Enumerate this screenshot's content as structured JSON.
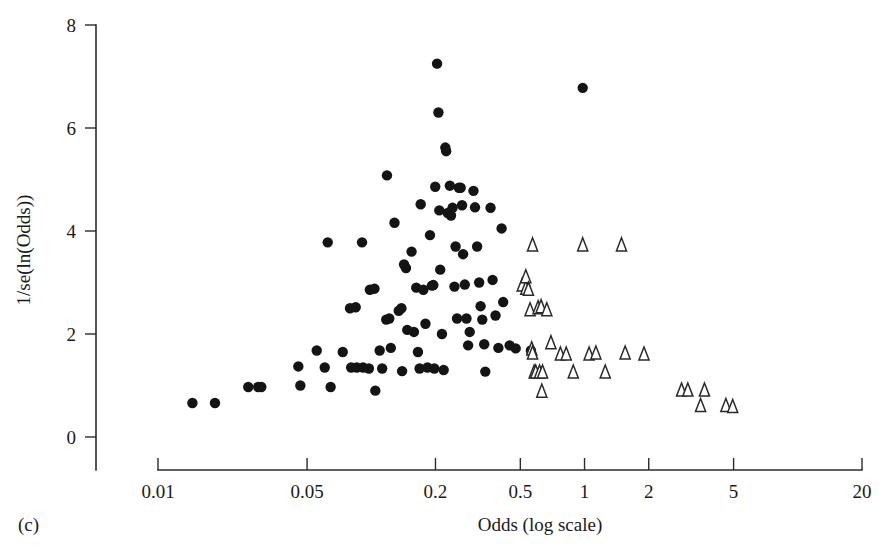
{
  "figure": {
    "panel_label": "(c)",
    "xlabel": "Odds (log scale)",
    "ylabel": "1/se(ln(Odds))",
    "point_color": "#141414",
    "triangle_stroke": "#2a2a2a",
    "axis_color": "#2b2b2b"
  },
  "chart_data": {
    "type": "scatter",
    "title": "",
    "subtitle": "",
    "panel": "(c)",
    "xlabel": "Odds (log scale)",
    "ylabel": "1/se(ln(Odds))",
    "xscale": "log",
    "yscale": "linear",
    "xlim": [
      0.01,
      20
    ],
    "ylim": [
      0,
      8
    ],
    "xticks": [
      0.01,
      0.05,
      0.2,
      0.5,
      1,
      2,
      5,
      20
    ],
    "xticklabels": [
      "0.01",
      "0.05",
      "0.2",
      "0.5",
      "1",
      "2",
      "5",
      "20"
    ],
    "yticks": [
      0,
      2,
      4,
      6,
      8
    ],
    "yticklabels": [
      "0",
      "2",
      "4",
      "6",
      "8"
    ],
    "grid": false,
    "legend": "none",
    "series": [
      {
        "name": "published studies",
        "marker": "filled-circle",
        "color": "#141414",
        "points": [
          [
            0.0145,
            0.66
          ],
          [
            0.0185,
            0.66
          ],
          [
            0.0265,
            0.97
          ],
          [
            0.0295,
            0.97
          ],
          [
            0.0305,
            0.97
          ],
          [
            0.0455,
            1.37
          ],
          [
            0.0465,
            1.0
          ],
          [
            0.0555,
            1.68
          ],
          [
            0.0625,
            3.78
          ],
          [
            0.0605,
            1.35
          ],
          [
            0.0645,
            0.97
          ],
          [
            0.0735,
            1.65
          ],
          [
            0.0795,
            2.5
          ],
          [
            0.0805,
            1.35
          ],
          [
            0.0855,
            1.35
          ],
          [
            0.0845,
            2.52
          ],
          [
            0.0905,
            3.78
          ],
          [
            0.0915,
            1.35
          ],
          [
            0.0985,
            2.86
          ],
          [
            0.0975,
            1.33
          ],
          [
            0.1035,
            2.88
          ],
          [
            0.1045,
            0.9
          ],
          [
            0.1095,
            1.68
          ],
          [
            0.1125,
            1.33
          ],
          [
            0.1175,
            2.28
          ],
          [
            0.1185,
            5.08
          ],
          [
            0.1215,
            2.3
          ],
          [
            0.1235,
            1.73
          ],
          [
            0.1285,
            4.16
          ],
          [
            0.1345,
            2.45
          ],
          [
            0.1385,
            2.5
          ],
          [
            0.1395,
            1.28
          ],
          [
            0.1425,
            3.35
          ],
          [
            0.1455,
            3.28
          ],
          [
            0.1475,
            2.08
          ],
          [
            0.1545,
            3.6
          ],
          [
            0.1585,
            2.04
          ],
          [
            0.1625,
            2.9
          ],
          [
            0.1655,
            1.65
          ],
          [
            0.1685,
            1.33
          ],
          [
            0.1705,
            4.52
          ],
          [
            0.1755,
            2.86
          ],
          [
            0.1795,
            2.2
          ],
          [
            0.1835,
            1.35
          ],
          [
            0.1885,
            3.92
          ],
          [
            0.1925,
            2.94
          ],
          [
            0.1955,
            2.95
          ],
          [
            0.1975,
            1.33
          ],
          [
            0.1995,
            4.86
          ],
          [
            0.2035,
            7.25
          ],
          [
            0.2065,
            6.3
          ],
          [
            0.2085,
            4.4
          ],
          [
            0.2105,
            3.25
          ],
          [
            0.2145,
            2.0
          ],
          [
            0.2185,
            1.3
          ],
          [
            0.2225,
            5.62
          ],
          [
            0.2245,
            5.55
          ],
          [
            0.2285,
            4.35
          ],
          [
            0.2335,
            4.88
          ],
          [
            0.2365,
            4.3
          ],
          [
            0.2405,
            4.45
          ],
          [
            0.2455,
            2.92
          ],
          [
            0.2485,
            3.7
          ],
          [
            0.2525,
            2.3
          ],
          [
            0.2575,
            4.84
          ],
          [
            0.2625,
            4.84
          ],
          [
            0.2665,
            4.5
          ],
          [
            0.2695,
            3.55
          ],
          [
            0.2745,
            2.96
          ],
          [
            0.2795,
            2.3
          ],
          [
            0.2845,
            1.78
          ],
          [
            0.2895,
            2.04
          ],
          [
            0.3015,
            4.78
          ],
          [
            0.3065,
            4.46
          ],
          [
            0.3135,
            3.7
          ],
          [
            0.3205,
            3.0
          ],
          [
            0.3255,
            2.54
          ],
          [
            0.3315,
            2.28
          ],
          [
            0.3385,
            1.8
          ],
          [
            0.3425,
            1.27
          ],
          [
            0.3625,
            4.45
          ],
          [
            0.3705,
            3.05
          ],
          [
            0.3825,
            2.36
          ],
          [
            0.3945,
            1.73
          ],
          [
            0.4085,
            4.05
          ],
          [
            0.4155,
            2.62
          ],
          [
            0.4455,
            1.78
          ],
          [
            0.4755,
            1.72
          ],
          [
            0.5285,
            2.92
          ],
          [
            0.5605,
            1.68
          ],
          [
            0.9805,
            6.78
          ]
        ]
      },
      {
        "name": "unpublished / grey literature studies",
        "marker": "open-triangle",
        "color": "#ffffff",
        "points": [
          [
            0.5105,
            2.94
          ],
          [
            0.5305,
            2.88
          ],
          [
            0.5305,
            3.1
          ],
          [
            0.5455,
            2.86
          ],
          [
            0.5555,
            2.46
          ],
          [
            0.5705,
            3.72
          ],
          [
            0.5655,
            1.7
          ],
          [
            0.5705,
            1.62
          ],
          [
            0.5805,
            1.25
          ],
          [
            0.5905,
            1.25
          ],
          [
            0.6055,
            2.5
          ],
          [
            0.6255,
            2.52
          ],
          [
            0.6155,
            1.25
          ],
          [
            0.6355,
            1.25
          ],
          [
            0.6305,
            0.88
          ],
          [
            0.6655,
            2.46
          ],
          [
            0.6955,
            1.82
          ],
          [
            0.7705,
            1.6
          ],
          [
            0.8205,
            1.6
          ],
          [
            0.8855,
            1.25
          ],
          [
            0.9805,
            3.72
          ],
          [
            1.0505,
            1.6
          ],
          [
            1.1305,
            1.62
          ],
          [
            1.2505,
            1.25
          ],
          [
            1.4905,
            3.72
          ],
          [
            1.5505,
            1.62
          ],
          [
            1.9005,
            1.6
          ],
          [
            2.8505,
            0.9
          ],
          [
            3.0505,
            0.9
          ],
          [
            3.6505,
            0.9
          ],
          [
            3.5005,
            0.6
          ],
          [
            4.6005,
            0.6
          ],
          [
            4.9505,
            0.58
          ]
        ]
      }
    ]
  },
  "geometry": {
    "x_pixel_min": 158,
    "x_pixel_max": 862,
    "y_pixel_zero": 437,
    "y_pixel_top": 25,
    "axis_x": 96,
    "axis_y": 470
  }
}
